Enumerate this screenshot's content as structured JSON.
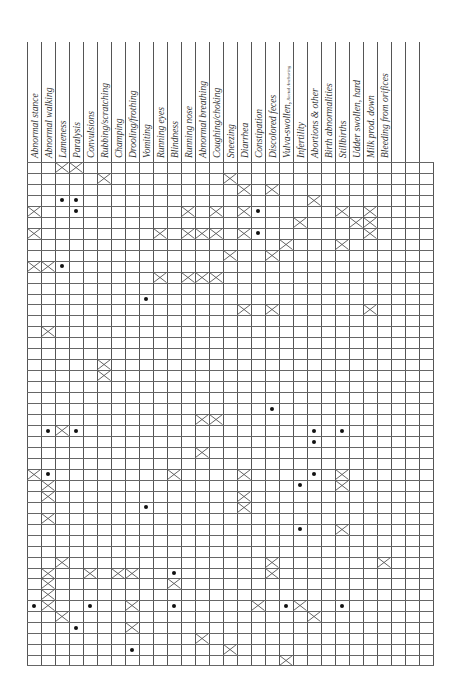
{
  "document": {
    "type": "symptom-checklist-grid",
    "orientation": "rotated",
    "grid": {
      "rows": 46,
      "cols": 29,
      "col_width": 14,
      "row_height": 10.96
    }
  },
  "columns": [
    {
      "label": "Abnormal stance"
    },
    {
      "label": "Abnormal walking"
    },
    {
      "label": "Lameness"
    },
    {
      "label": "Paralysis"
    },
    {
      "label": "Convulsions"
    },
    {
      "label": "Rubbing/scratching"
    },
    {
      "label": "Champing"
    },
    {
      "label": "Drooling/frothing"
    },
    {
      "label": "Vomiting"
    },
    {
      "label": "Running eyes"
    },
    {
      "label": "Blindness"
    },
    {
      "label": "Running nose"
    },
    {
      "label": "Abnormal breathing"
    },
    {
      "label": "Coughing/choking"
    },
    {
      "label": "Sneezing"
    },
    {
      "label": "Diarrhea"
    },
    {
      "label": "Constipation"
    },
    {
      "label": "Discolored feces"
    },
    {
      "label": "Vulva-swollen,",
      "note": "Rectal Anchoring"
    },
    {
      "label": "Infertility"
    },
    {
      "label": "Abortions & other"
    },
    {
      "label": "Birth abnormalities"
    },
    {
      "label": "Stillbirths"
    },
    {
      "label": "Udder swollen, hard"
    },
    {
      "label": "Milk prod. down"
    },
    {
      "label": "Bleeding from orifices"
    },
    {
      "label": ""
    },
    {
      "label": ""
    },
    {
      "label": ""
    }
  ],
  "marks": [
    {
      "r": 0,
      "c": 2,
      "t": "x"
    },
    {
      "r": 0,
      "c": 3,
      "t": "x"
    },
    {
      "r": 1,
      "c": 5,
      "t": "x"
    },
    {
      "r": 1,
      "c": 14,
      "t": "x"
    },
    {
      "r": 2,
      "c": 15,
      "t": "x"
    },
    {
      "r": 2,
      "c": 17,
      "t": "x"
    },
    {
      "r": 3,
      "c": 2,
      "t": "dot"
    },
    {
      "r": 3,
      "c": 3,
      "t": "dot"
    },
    {
      "r": 3,
      "c": 20,
      "t": "x"
    },
    {
      "r": 4,
      "c": 0,
      "t": "x"
    },
    {
      "r": 4,
      "c": 3,
      "t": "dot"
    },
    {
      "r": 4,
      "c": 11,
      "t": "x"
    },
    {
      "r": 4,
      "c": 13,
      "t": "x"
    },
    {
      "r": 4,
      "c": 15,
      "t": "x"
    },
    {
      "r": 4,
      "c": 16,
      "t": "dot"
    },
    {
      "r": 4,
      "c": 22,
      "t": "x"
    },
    {
      "r": 4,
      "c": 24,
      "t": "x"
    },
    {
      "r": 5,
      "c": 19,
      "t": "x"
    },
    {
      "r": 5,
      "c": 23,
      "t": "x"
    },
    {
      "r": 5,
      "c": 24,
      "t": "x"
    },
    {
      "r": 6,
      "c": 0,
      "t": "x"
    },
    {
      "r": 6,
      "c": 9,
      "t": "x"
    },
    {
      "r": 6,
      "c": 11,
      "t": "x"
    },
    {
      "r": 6,
      "c": 12,
      "t": "x"
    },
    {
      "r": 6,
      "c": 13,
      "t": "x"
    },
    {
      "r": 6,
      "c": 15,
      "t": "x"
    },
    {
      "r": 6,
      "c": 16,
      "t": "dot"
    },
    {
      "r": 6,
      "c": 24,
      "t": "x"
    },
    {
      "r": 7,
      "c": 18,
      "t": "x"
    },
    {
      "r": 7,
      "c": 22,
      "t": "x"
    },
    {
      "r": 8,
      "c": 14,
      "t": "x"
    },
    {
      "r": 8,
      "c": 17,
      "t": "x"
    },
    {
      "r": 9,
      "c": 0,
      "t": "x"
    },
    {
      "r": 9,
      "c": 1,
      "t": "x"
    },
    {
      "r": 9,
      "c": 2,
      "t": "dot"
    },
    {
      "r": 10,
      "c": 9,
      "t": "x"
    },
    {
      "r": 10,
      "c": 11,
      "t": "x"
    },
    {
      "r": 10,
      "c": 12,
      "t": "x"
    },
    {
      "r": 10,
      "c": 13,
      "t": "x"
    },
    {
      "r": 12,
      "c": 8,
      "t": "dot"
    },
    {
      "r": 13,
      "c": 15,
      "t": "x"
    },
    {
      "r": 13,
      "c": 17,
      "t": "x"
    },
    {
      "r": 13,
      "c": 24,
      "t": "x"
    },
    {
      "r": 15,
      "c": 1,
      "t": "x"
    },
    {
      "r": 18,
      "c": 5,
      "t": "x"
    },
    {
      "r": 19,
      "c": 5,
      "t": "x"
    },
    {
      "r": 22,
      "c": 17,
      "t": "dot"
    },
    {
      "r": 23,
      "c": 12,
      "t": "x"
    },
    {
      "r": 23,
      "c": 13,
      "t": "x"
    },
    {
      "r": 24,
      "c": 1,
      "t": "dot"
    },
    {
      "r": 24,
      "c": 2,
      "t": "x"
    },
    {
      "r": 24,
      "c": 3,
      "t": "dot"
    },
    {
      "r": 24,
      "c": 20,
      "t": "dot"
    },
    {
      "r": 24,
      "c": 22,
      "t": "dot"
    },
    {
      "r": 25,
      "c": 20,
      "t": "dot"
    },
    {
      "r": 26,
      "c": 12,
      "t": "x"
    },
    {
      "r": 28,
      "c": 0,
      "t": "x"
    },
    {
      "r": 28,
      "c": 1,
      "t": "dot"
    },
    {
      "r": 28,
      "c": 10,
      "t": "x"
    },
    {
      "r": 28,
      "c": 15,
      "t": "x"
    },
    {
      "r": 28,
      "c": 20,
      "t": "dot"
    },
    {
      "r": 28,
      "c": 22,
      "t": "x"
    },
    {
      "r": 29,
      "c": 1,
      "t": "x"
    },
    {
      "r": 29,
      "c": 19,
      "t": "dot"
    },
    {
      "r": 29,
      "c": 22,
      "t": "x"
    },
    {
      "r": 30,
      "c": 1,
      "t": "x"
    },
    {
      "r": 30,
      "c": 15,
      "t": "x"
    },
    {
      "r": 31,
      "c": 8,
      "t": "dot"
    },
    {
      "r": 31,
      "c": 15,
      "t": "x"
    },
    {
      "r": 32,
      "c": 1,
      "t": "x"
    },
    {
      "r": 33,
      "c": 19,
      "t": "dot"
    },
    {
      "r": 33,
      "c": 22,
      "t": "x"
    },
    {
      "r": 36,
      "c": 2,
      "t": "x"
    },
    {
      "r": 36,
      "c": 17,
      "t": "x"
    },
    {
      "r": 36,
      "c": 25,
      "t": "x"
    },
    {
      "r": 37,
      "c": 1,
      "t": "x"
    },
    {
      "r": 37,
      "c": 4,
      "t": "x"
    },
    {
      "r": 37,
      "c": 6,
      "t": "x"
    },
    {
      "r": 37,
      "c": 7,
      "t": "x"
    },
    {
      "r": 37,
      "c": 10,
      "t": "dot"
    },
    {
      "r": 37,
      "c": 17,
      "t": "x"
    },
    {
      "r": 38,
      "c": 1,
      "t": "x"
    },
    {
      "r": 38,
      "c": 10,
      "t": "x"
    },
    {
      "r": 39,
      "c": 1,
      "t": "x"
    },
    {
      "r": 40,
      "c": 0,
      "t": "dot"
    },
    {
      "r": 40,
      "c": 1,
      "t": "x"
    },
    {
      "r": 40,
      "c": 4,
      "t": "dot"
    },
    {
      "r": 40,
      "c": 7,
      "t": "x"
    },
    {
      "r": 40,
      "c": 10,
      "t": "dot"
    },
    {
      "r": 40,
      "c": 16,
      "t": "x"
    },
    {
      "r": 40,
      "c": 18,
      "t": "dot"
    },
    {
      "r": 40,
      "c": 19,
      "t": "x"
    },
    {
      "r": 40,
      "c": 22,
      "t": "dot"
    },
    {
      "r": 41,
      "c": 2,
      "t": "x"
    },
    {
      "r": 41,
      "c": 20,
      "t": "x"
    },
    {
      "r": 42,
      "c": 3,
      "t": "dot"
    },
    {
      "r": 42,
      "c": 7,
      "t": "x"
    },
    {
      "r": 43,
      "c": 12,
      "t": "x"
    },
    {
      "r": 44,
      "c": 7,
      "t": "dot"
    },
    {
      "r": 44,
      "c": 14,
      "t": "x"
    },
    {
      "r": 45,
      "c": 18,
      "t": "x"
    }
  ],
  "colors": {
    "line": "#555555",
    "ink": "#111111",
    "paper": "#ffffff"
  }
}
